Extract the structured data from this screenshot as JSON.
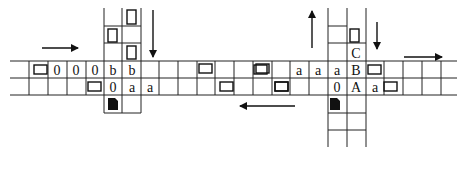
{
  "labels": {
    "major_stream_top": "Major-stream",
    "major_stream_bottom": "Major-stream",
    "minor_stream_a": "Minor-stream",
    "minor_stream_b": "Minor-stream",
    "v_a": "v",
    "v_b": "v",
    "caption_a": "( a )",
    "caption_b": "( b )"
  },
  "grid": {
    "row_top_y": 61,
    "row_mid_y": 78,
    "row_bot_y": 95,
    "x_start": 10,
    "x_end": 457,
    "columns_x": [
      10,
      29,
      48,
      67,
      86,
      104,
      122,
      141,
      159,
      178,
      197,
      215,
      234,
      253,
      272,
      290,
      309,
      328,
      347,
      366,
      384,
      403,
      422,
      441,
      457
    ]
  },
  "panel_a": {
    "vertical_lanes_x": [
      104,
      122,
      141
    ],
    "top_row_cells": [
      {
        "col": 1,
        "content": "car"
      },
      {
        "col": 2,
        "content": "0"
      },
      {
        "col": 3,
        "content": "0"
      },
      {
        "col": 4,
        "content": "0"
      },
      {
        "col": 5,
        "content": "b"
      },
      {
        "col": 6,
        "content": "b"
      }
    ],
    "bottom_row_cells": [
      {
        "col": 4,
        "content": "car"
      },
      {
        "col": 5,
        "content": "0"
      },
      {
        "col": 6,
        "content": "a"
      },
      {
        "col": 7,
        "content": "a"
      }
    ],
    "upper_lane_cars": [
      {
        "lane": 1,
        "row": 0
      },
      {
        "lane": 0,
        "row": 1
      },
      {
        "lane": 1,
        "row": 2
      }
    ]
  },
  "panel_b": {
    "vertical_lanes_x": [
      328,
      347,
      366
    ],
    "top_row_cells": [
      {
        "col": 13,
        "content": "car"
      },
      {
        "col": 15,
        "content": "a"
      },
      {
        "col": 16,
        "content": "a"
      },
      {
        "col": 17,
        "content": "a"
      },
      {
        "col": 18,
        "content": "B"
      },
      {
        "col": 19,
        "content": "car"
      }
    ],
    "bottom_row_cells": [
      {
        "col": 14,
        "content": "car"
      },
      {
        "col": 17,
        "content": "0"
      },
      {
        "col": 18,
        "content": "A"
      },
      {
        "col": 19,
        "content": "a"
      },
      {
        "col": 20,
        "content": "car"
      }
    ],
    "upper_lane_cells": [
      {
        "lane": 1,
        "row": 1,
        "content": "car"
      },
      {
        "lane": 1,
        "row": 2,
        "content": "C"
      }
    ]
  },
  "middle_cars": {
    "top_row_cols": [
      9,
      12
    ],
    "bottom_row_cols": [
      7,
      11
    ]
  }
}
